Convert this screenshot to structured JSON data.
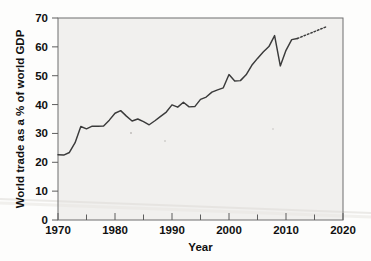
{
  "figure": {
    "background_color": "#fdfdfc",
    "plot_background_color": "#f1f0ee",
    "line_color": "#3b3b3b",
    "axis_color": "#6f6f6f"
  },
  "chart_data": {
    "type": "line",
    "title": "",
    "subtitle": "",
    "xlabel": "Year",
    "ylabel": "World trade as a % of world GDP",
    "xlim": [
      1970,
      2020
    ],
    "ylim": [
      0,
      70
    ],
    "xticks": [
      1970,
      1980,
      1990,
      2000,
      2010,
      2020
    ],
    "xtick_labels": [
      "1970",
      "1980",
      "1990",
      "2000",
      "2010",
      "2020"
    ],
    "xminor_ticks": [
      1975,
      1985,
      1995,
      2005,
      2015
    ],
    "yticks": [
      0,
      10,
      20,
      30,
      40,
      50,
      60,
      70
    ],
    "ytick_labels": [
      "0",
      "10",
      "20",
      "30",
      "40",
      "50",
      "60",
      "70"
    ],
    "grid": false,
    "legend": null,
    "legend_position": "none",
    "series": [
      {
        "name": "World trade as a % of world GDP",
        "style": "solid",
        "x": [
          1970,
          1971,
          1972,
          1973,
          1974,
          1975,
          1976,
          1977,
          1978,
          1979,
          1980,
          1981,
          1982,
          1983,
          1984,
          1985,
          1986,
          1987,
          1988,
          1989,
          1990,
          1991,
          1992,
          1993,
          1994,
          1995,
          1996,
          1997,
          1998,
          1999,
          2000,
          2001,
          2002,
          2003,
          2004,
          2005,
          2006,
          2007,
          2008,
          2009,
          2010,
          2011,
          2012
        ],
        "values": [
          22.6,
          22.5,
          23.4,
          26.8,
          32.4,
          31.6,
          32.5,
          32.5,
          32.6,
          34.6,
          37.0,
          37.9,
          36.0,
          34.3,
          35.0,
          34.1,
          33.0,
          34.4,
          35.9,
          37.4,
          39.9,
          39.1,
          40.8,
          39.2,
          39.3,
          41.8,
          42.6,
          44.3,
          45.1,
          45.8,
          50.4,
          48.2,
          48.3,
          50.3,
          53.6,
          56.0,
          58.2,
          60.1,
          63.9,
          53.4,
          58.8,
          62.5,
          62.9
        ]
      },
      {
        "name": "Projection",
        "style": "dotted",
        "x": [
          2012,
          2013,
          2014,
          2015,
          2016,
          2017
        ],
        "values": [
          62.9,
          63.7,
          64.5,
          65.3,
          66.1,
          66.9
        ]
      }
    ]
  }
}
